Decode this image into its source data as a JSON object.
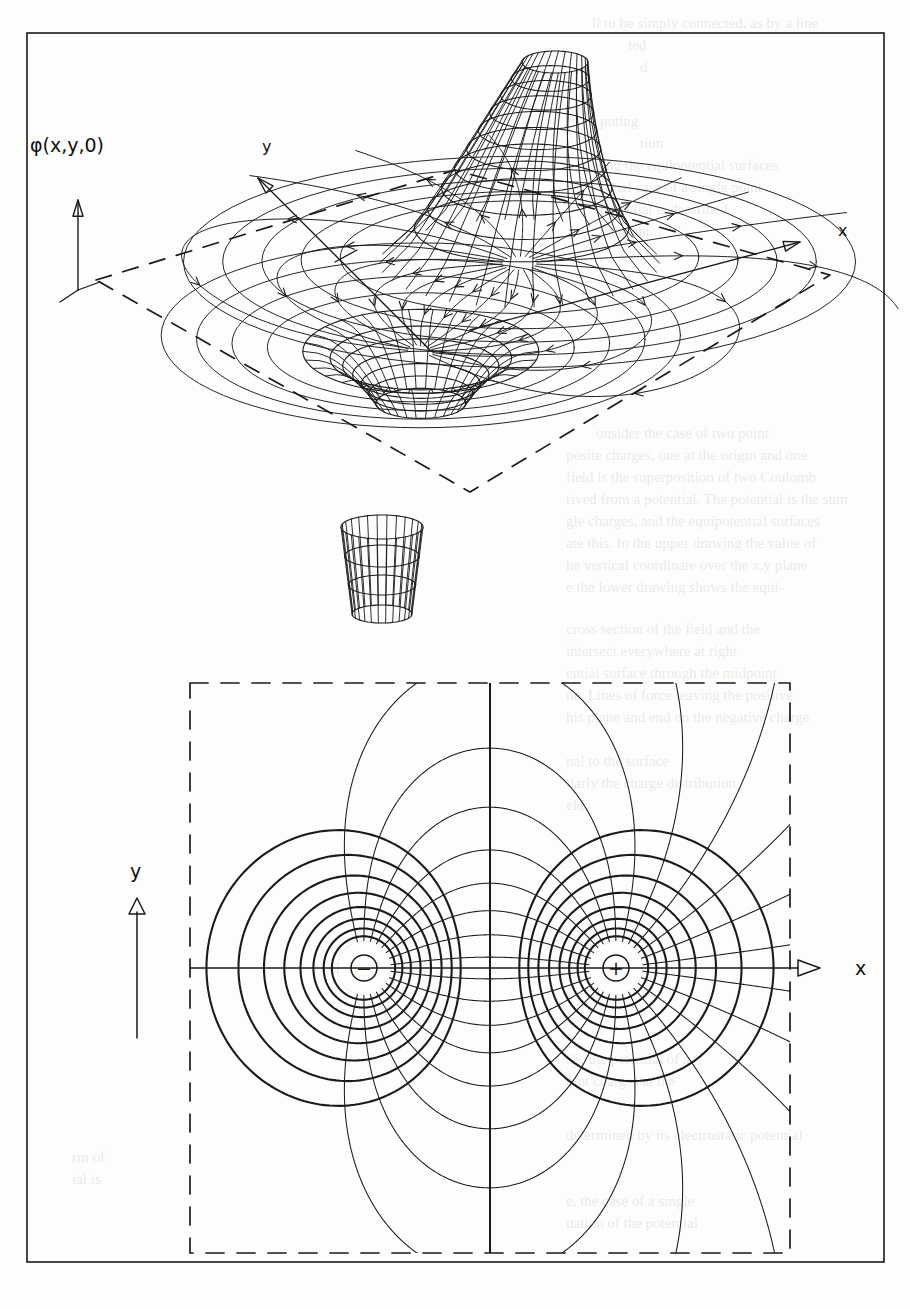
{
  "figure": {
    "kind": "electric-dipole-potential-and-field",
    "frame": {
      "x": 27,
      "y": 33,
      "width": 857,
      "height": 1229,
      "stroke": "#1a1a1a",
      "stroke_width": 1.6
    },
    "background_color": "#fdfdfc",
    "ink_color": "#1a1a1a"
  },
  "labels": {
    "phi_axis": "φ(x,y,0)",
    "top_y_axis": "y",
    "top_x_axis": "x",
    "bottom_y_axis": "y",
    "bottom_x_axis": "x",
    "negative_charge": "⊖",
    "positive_charge": "⊕"
  },
  "top_panel": {
    "name": "3d-surface-plot",
    "description": "Wireframe surface of the dipole potential phi(x,y,0) over a dashed parallelogram ground plane, with a tall chimney at the positive charge and a funnel well at the negative charge; in-plane field lines with arrow ticks are drawn on the ground plane.",
    "center": {
      "x": 455,
      "y": 330
    },
    "plane": {
      "corners": [
        [
          96,
          280
        ],
        [
          455,
          170
        ],
        [
          830,
          275
        ],
        [
          470,
          492
        ]
      ],
      "dash": "16 12",
      "stroke_width": 1.7
    },
    "axes": {
      "phi": {
        "from": [
          78,
          290
        ],
        "to": [
          78,
          200
        ],
        "label_at": [
          30,
          152
        ]
      },
      "y": {
        "from": [
          430,
          350
        ],
        "to": [
          258,
          178
        ],
        "label_at": [
          262,
          152
        ]
      },
      "x": {
        "from": [
          470,
          330
        ],
        "to": [
          800,
          242
        ],
        "label_at": [
          838,
          236
        ]
      }
    },
    "positive_charge_screen": {
      "x": 573,
      "y": 304
    },
    "negative_charge_screen": {
      "x": 330,
      "y": 412
    },
    "peak": {
      "top_center": [
        555,
        62
      ],
      "top_rx": 33,
      "top_ry": 11,
      "base_rx": 140,
      "base_ry": 44,
      "meridians": 30,
      "parallels": 9
    },
    "well": {
      "mouth_center": [
        330,
        404
      ],
      "mouth_rx": 118,
      "mouth_ry": 42,
      "throat_rx": 45,
      "throat_ry": 15,
      "throat_depth": 52,
      "meridians": 30,
      "parallels": 6
    },
    "detached_cup": {
      "top_center": [
        382,
        527
      ],
      "top_rx": 41,
      "top_ry": 12,
      "bottom_center": [
        382,
        614
      ],
      "bottom_rx": 30,
      "bottom_ry": 9,
      "meridians": 26,
      "parallels": 3
    },
    "field_lines": {
      "count": 22,
      "arrow_ticks_per_line": 2
    }
  },
  "bottom_panel": {
    "name": "2d-equipotential-field-map",
    "description": "Plan view of the dipole in the z = 0 plane: thick closed equipotential curves around each point charge, thin field lines running from the + charge to the - charge, a straight vertical zero-potential line midway, and a dashed square boundary.",
    "box": {
      "x": 190,
      "y": 683,
      "width": 600,
      "height": 570,
      "dash": "18 13",
      "stroke_width": 1.7
    },
    "center": {
      "x": 490,
      "y": 968
    },
    "positive_charge": {
      "x": 616,
      "y": 968,
      "label": "⊕"
    },
    "negative_charge": {
      "x": 364,
      "y": 968,
      "label": "⊖"
    },
    "charge_marker_radius": 13,
    "charge_blank_radius": 27,
    "zero_line": {
      "x": 490,
      "y_from": 683,
      "y_to": 1253
    },
    "axes": {
      "y": {
        "from": [
          137,
          1038
        ],
        "to": [
          137,
          898
        ],
        "label_at": [
          130,
          878
        ]
      },
      "x": {
        "from": [
          190,
          968
        ],
        "to": [
          820,
          968
        ],
        "label_at": [
          855,
          975
        ]
      }
    },
    "equipotentials": {
      "levels_per_charge": 17,
      "stroke_width": 2.1
    },
    "field_lines": {
      "count": 26,
      "stroke_width": 1.05
    }
  },
  "chart_data": {
    "type": "line",
    "xlabel": "x",
    "ylabel": "y",
    "zlabel": "φ(x,y,0)",
    "charges": [
      {
        "label": "⊖",
        "sign": -1,
        "x": -1.0,
        "y": 0.0
      },
      {
        "label": "⊕",
        "sign": 1,
        "x": 1.0,
        "y": 0.0
      }
    ],
    "xlim": [
      -2.6,
      2.6
    ],
    "ylim": [
      -2.4,
      2.4
    ],
    "grid": false,
    "legend": "none",
    "annotations": [
      "φ(x,y,0)",
      "x",
      "y",
      "⊕",
      "⊖"
    ]
  },
  "ghost_text": [
    {
      "text": "ll to be simply connected, as by a line",
      "x": 592,
      "y": 28,
      "size": 15
    },
    {
      "text": "ted",
      "x": 628,
      "y": 50,
      "size": 15
    },
    {
      "text": "d",
      "x": 640,
      "y": 72,
      "size": 15
    },
    {
      "text": "puting",
      "x": 600,
      "y": 126,
      "size": 15
    },
    {
      "text": "tion",
      "x": 640,
      "y": 148,
      "size": 15
    },
    {
      "text": "sing the equipotential surfaces",
      "x": 596,
      "y": 170,
      "size": 15
    },
    {
      "text": "rivial case of a single point",
      "x": 600,
      "y": 192,
      "size": 15
    },
    {
      "text": "potential is described",
      "x": 600,
      "y": 214,
      "size": 15
    },
    {
      "text": "constant",
      "x": 600,
      "y": 236,
      "size": 15
    },
    {
      "text": "onsider the case of two point",
      "x": 596,
      "y": 438,
      "size": 15
    },
    {
      "text": "posite charges, one at the origin and one",
      "x": 566,
      "y": 460,
      "size": 15
    },
    {
      "text": "field is the superposition of two Coulomb",
      "x": 566,
      "y": 482,
      "size": 15
    },
    {
      "text": "rived from a potential. The potential is the sum",
      "x": 566,
      "y": 504,
      "size": 15
    },
    {
      "text": "gle charges, and the equipotential surfaces",
      "x": 566,
      "y": 526,
      "size": 15
    },
    {
      "text": "ate this. In the upper drawing the value of",
      "x": 566,
      "y": 548,
      "size": 15
    },
    {
      "text": "he vertical coordinate over the x,y plane",
      "x": 566,
      "y": 570,
      "size": 15
    },
    {
      "text": "e the lower drawing shows the equi-",
      "x": 566,
      "y": 592,
      "size": 15
    },
    {
      "text": "cross section of the field and the",
      "x": 566,
      "y": 634,
      "size": 15
    },
    {
      "text": "intersect everywhere at right",
      "x": 566,
      "y": 656,
      "size": 15
    },
    {
      "text": "ential surface through the midpoint",
      "x": 566,
      "y": 678,
      "size": 15
    },
    {
      "text": "ne. Lines of force leaving the positive",
      "x": 566,
      "y": 700,
      "size": 15
    },
    {
      "text": "his plane and end on the negative charge",
      "x": 566,
      "y": 722,
      "size": 15
    },
    {
      "text": "nal to the surface",
      "x": 566,
      "y": 766,
      "size": 15
    },
    {
      "text": "ilarly the charge distribution",
      "x": 566,
      "y": 788,
      "size": 15
    },
    {
      "text": "eld",
      "x": 566,
      "y": 810,
      "size": 15
    },
    {
      "text": "lly, the potential of a",
      "x": 566,
      "y": 1064,
      "size": 15
    },
    {
      "text": "oint charges at the",
      "x": 566,
      "y": 1086,
      "size": 15
    },
    {
      "text": "determined by its electrostatic potential",
      "x": 566,
      "y": 1140,
      "size": 15
    },
    {
      "text": "e, the case of a single",
      "x": 566,
      "y": 1206,
      "size": 15
    },
    {
      "text": "uation of the potential",
      "x": 566,
      "y": 1228,
      "size": 15
    },
    {
      "text": "rm of",
      "x": 72,
      "y": 1162,
      "size": 15
    },
    {
      "text": "ial is",
      "x": 72,
      "y": 1184,
      "size": 15
    }
  ]
}
